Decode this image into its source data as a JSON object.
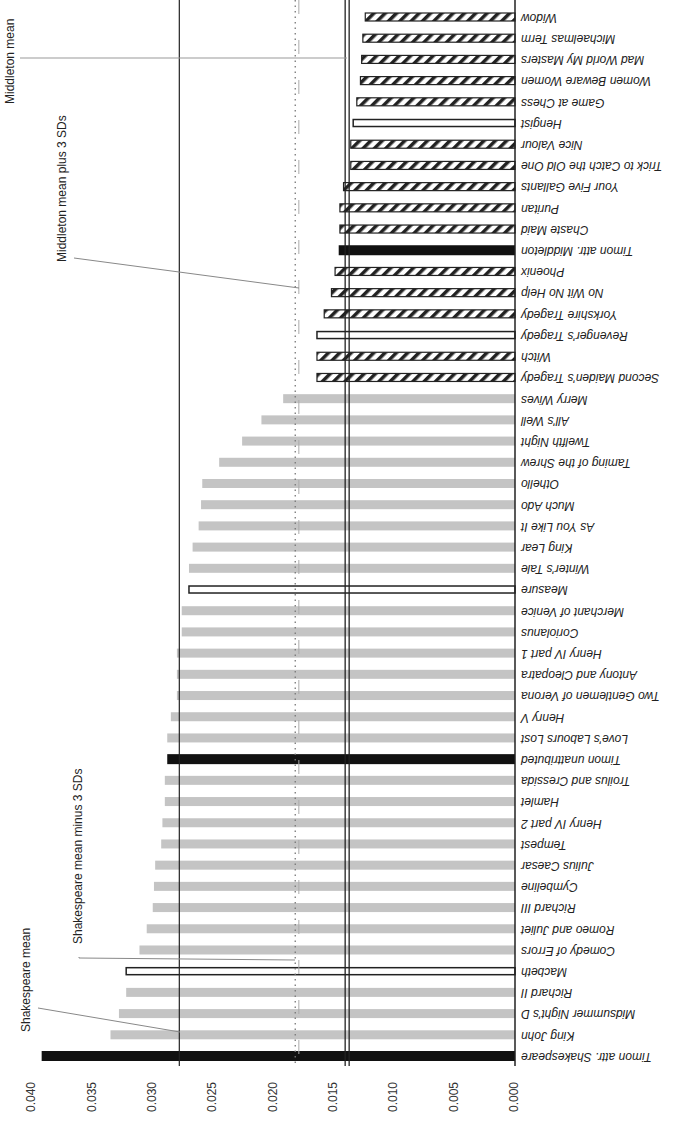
{
  "chart_data": {
    "type": "bar",
    "orientation": "horizontal (image rotated; value axis along bottom, increasing to the left)",
    "title": "",
    "xlabel": "",
    "ylabel": "",
    "xlim": [
      0,
      0.04
    ],
    "ticks": [
      "0.040",
      "0.035",
      "0.030",
      "0.025",
      "0.020",
      "0.015",
      "0.010",
      "0.005",
      "0.000"
    ],
    "legend": [],
    "categories": [
      "Timon attr. Shakespeare",
      "King John",
      "Midsummer Night's D",
      "Richard II",
      "Macbeth",
      "Comedy of Errors",
      "Romeo and Juliet",
      "Richard III",
      "Cymbeline",
      "Julius Caesar",
      "Tempest",
      "Henry IV part 2",
      "Hamlet",
      "Troilus and Cressida",
      "Timon unattributed",
      "Love's Labours Lost",
      "Henry V",
      "Two Gentlemen of Verona",
      "Antony and Cleopatra",
      "Henry IV part 1",
      "Coriolanus",
      "Merchant of Venice",
      "Measure",
      "Winter's Tale",
      "King Lear",
      "As You Like It",
      "Much Ado",
      "Othello",
      "Taming of the Shrew",
      "Twelfth Night",
      "All's Well",
      "Merry Wives",
      "Second Maiden's Tragedy",
      "Witch",
      "Revenger's Tragedy",
      "Yorkshire Tragedy",
      "No Wit No Help",
      "Phoenix",
      "Timon attr. Middleton",
      "Chaste Maid",
      "Puritan",
      "Your Five Gallants",
      "Trick to Catch the Old One",
      "Nice Valour",
      "Hengist",
      "Game at Chess",
      "Women Beware Women",
      "Mad World My Masters",
      "Michaelmas Term",
      "Widow"
    ],
    "values": [
      0.0392,
      0.0335,
      0.0328,
      0.0322,
      0.0322,
      0.0311,
      0.0305,
      0.03,
      0.0299,
      0.0298,
      0.0293,
      0.0292,
      0.029,
      0.029,
      0.0288,
      0.0288,
      0.0285,
      0.028,
      0.028,
      0.028,
      0.0276,
      0.0276,
      0.027,
      0.027,
      0.0267,
      0.0262,
      0.026,
      0.0259,
      0.0245,
      0.0226,
      0.021,
      0.0192,
      0.0164,
      0.0164,
      0.0164,
      0.0158,
      0.0152,
      0.0149,
      0.0146,
      0.0145,
      0.0145,
      0.0142,
      0.0136,
      0.0136,
      0.0134,
      0.0131,
      0.0128,
      0.0127,
      0.0126,
      0.0124
    ],
    "styles": [
      "solid-black",
      "gray",
      "gray",
      "gray",
      "outline",
      "gray",
      "gray",
      "gray",
      "gray",
      "gray",
      "gray",
      "gray",
      "gray",
      "gray",
      "solid-black",
      "gray",
      "gray",
      "gray",
      "gray",
      "gray",
      "gray",
      "gray",
      "outline",
      "gray",
      "gray",
      "gray",
      "gray",
      "gray",
      "gray",
      "gray",
      "gray",
      "gray",
      "hatched",
      "hatched",
      "outline",
      "hatched",
      "hatched",
      "hatched",
      "solid-black",
      "hatched",
      "hatched",
      "hatched",
      "hatched",
      "hatched",
      "outline",
      "hatched",
      "hatched",
      "hatched",
      "hatched",
      "hatched"
    ],
    "reference_lines": [
      {
        "label": "Shakespeare mean",
        "value": 0.0278,
        "style": "solid"
      },
      {
        "label": "Shakespeare mean minus 3 SDs",
        "value": 0.0182,
        "style": "dotted"
      },
      {
        "label": "Middleton mean plus 3 SDs",
        "value": 0.0179,
        "style": "dashed-gray"
      },
      {
        "label": "Middleton mean",
        "value": 0.0139,
        "style": "double"
      }
    ]
  },
  "annotations": {
    "shakespeare_mean": "Shakespeare mean",
    "shakespeare_minus": "Shakespeare mean minus 3 SDs",
    "middleton_plus": "Middleton mean plus 3 SDs",
    "middleton_mean": "Middleton mean"
  },
  "colors": {
    "gray_bar": "#c4c4c4",
    "black_bar": "#111111",
    "line": "#222222",
    "dotted": "#888888"
  }
}
